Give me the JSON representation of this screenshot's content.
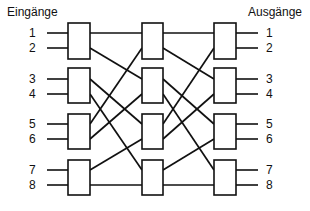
{
  "diagram": {
    "title_left": "Eingänge",
    "title_right": "Ausgänge",
    "inputs": [
      "1",
      "2",
      "3",
      "4",
      "5",
      "6",
      "7",
      "8"
    ],
    "outputs": [
      "1",
      "2",
      "3",
      "4",
      "5",
      "6",
      "7",
      "8"
    ],
    "port_y": [
      33,
      48,
      79,
      94,
      124,
      139,
      170,
      185
    ],
    "columns": [
      {
        "name": "stage-1",
        "x": 68,
        "w": 22
      },
      {
        "name": "stage-2",
        "x": 142,
        "w": 21
      },
      {
        "name": "stage-3",
        "x": 214,
        "w": 22
      }
    ],
    "box_rows": [
      {
        "y": 23,
        "h": 36
      },
      {
        "y": 68,
        "h": 35
      },
      {
        "y": 114,
        "h": 35
      },
      {
        "y": 160,
        "h": 35
      }
    ],
    "links_stage1": [
      [
        0,
        0
      ],
      [
        1,
        2
      ],
      [
        2,
        4
      ],
      [
        3,
        6
      ],
      [
        4,
        1
      ],
      [
        5,
        3
      ],
      [
        6,
        5
      ],
      [
        7,
        7
      ]
    ],
    "links_stage2": [
      [
        0,
        0
      ],
      [
        1,
        2
      ],
      [
        2,
        4
      ],
      [
        3,
        6
      ],
      [
        4,
        1
      ],
      [
        5,
        3
      ],
      [
        6,
        5
      ],
      [
        7,
        7
      ]
    ],
    "line_color": "#111111"
  }
}
